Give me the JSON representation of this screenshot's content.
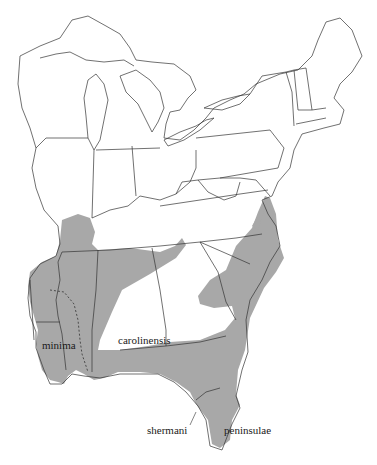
{
  "map": {
    "title": "",
    "fill_color": "#a8a8a8",
    "border_color": "#333333",
    "background": "#ffffff",
    "labels": {
      "minima": "minima",
      "carolinensis": "carolinensis",
      "shermani": "shermani",
      "peninsulae": "peninsulae"
    }
  }
}
